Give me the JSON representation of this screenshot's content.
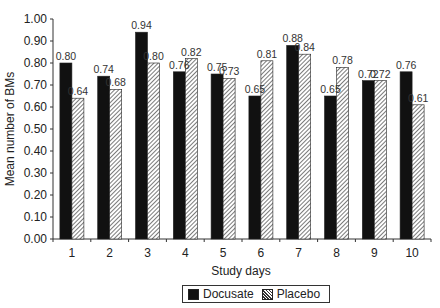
{
  "chart_data": {
    "type": "bar",
    "title": "",
    "xlabel": "Study days",
    "ylabel": "Mean number of BMs",
    "categories": [
      "1",
      "2",
      "3",
      "4",
      "5",
      "6",
      "7",
      "8",
      "9",
      "10"
    ],
    "series": [
      {
        "name": "Docusate",
        "values": [
          0.8,
          0.74,
          0.94,
          0.76,
          0.75,
          0.65,
          0.88,
          0.65,
          0.72,
          0.76
        ],
        "fill": "#111111"
      },
      {
        "name": "Placebo",
        "values": [
          0.64,
          0.68,
          0.8,
          0.82,
          0.73,
          0.81,
          0.84,
          0.78,
          0.72,
          0.61
        ],
        "fill": "hatched"
      }
    ],
    "ylim": [
      0,
      1.0
    ],
    "yticks": [
      "0.00",
      "0.10",
      "0.20",
      "0.30",
      "0.40",
      "0.50",
      "0.60",
      "0.70",
      "0.80",
      "0.90",
      "1.00"
    ],
    "data_labels": true,
    "grid": false,
    "legend_position": "bottom"
  },
  "legend": {
    "docusate": "Docusate",
    "placebo": "Placebo"
  }
}
